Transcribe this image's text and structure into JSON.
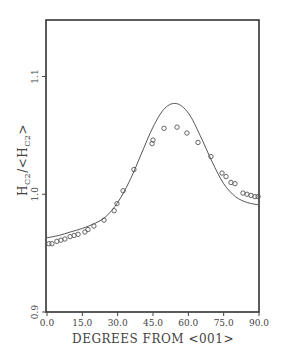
{
  "chart_data": {
    "type": "scatter",
    "title": "",
    "xlabel": "DEGREES FROM <001>",
    "ylabel": "H_C2/<H_C2>",
    "ylabel_parts": {
      "main": "H",
      "sub": "C2",
      "sep": "/<H",
      "sub2": "C2",
      "end": ">"
    },
    "xlim": [
      0,
      90
    ],
    "ylim": [
      0.9,
      1.148
    ],
    "x_ticks": [
      0,
      15,
      30,
      45,
      60,
      75,
      90
    ],
    "x_tick_labels": [
      "0.0",
      "15.0",
      "30.0",
      "45.0",
      "60.0",
      "75.0",
      "90.0"
    ],
    "y_ticks": [
      0.9,
      1.0,
      1.1
    ],
    "y_tick_labels": [
      "0.9",
      "1.0",
      "1.1"
    ],
    "grid": false,
    "legend": null,
    "series": [
      {
        "name": "measured",
        "style": "open-circles",
        "x": [
          0.8,
          2.1,
          4.2,
          5.9,
          7.6,
          9.8,
          11.5,
          13.2,
          16.1,
          17.4,
          19.9,
          24.2,
          28.5,
          29.7,
          32.3,
          36.9,
          44.6,
          45.0,
          49.7,
          55.2,
          59.4,
          64.1,
          69.6,
          74.3,
          76.0,
          78.1,
          79.8,
          83.2,
          84.9,
          86.6,
          88.3,
          89.6
        ],
        "y": [
          0.958,
          0.958,
          0.96,
          0.961,
          0.962,
          0.964,
          0.965,
          0.966,
          0.968,
          0.97,
          0.973,
          0.978,
          0.986,
          0.992,
          1.003,
          1.021,
          1.043,
          1.046,
          1.056,
          1.057,
          1.052,
          1.044,
          1.032,
          1.018,
          1.015,
          1.01,
          1.009,
          1.001,
          1.0,
          0.999,
          0.998,
          0.998
        ]
      },
      {
        "name": "theory",
        "style": "solid-line",
        "x": [
          0,
          5,
          10,
          15,
          20,
          25,
          30,
          35,
          40,
          45,
          50,
          55,
          60,
          65,
          70,
          75,
          80,
          85,
          90
        ],
        "y": [
          0.963,
          0.965,
          0.968,
          0.971,
          0.975,
          0.981,
          0.993,
          1.011,
          1.034,
          1.057,
          1.073,
          1.077,
          1.069,
          1.05,
          1.028,
          1.009,
          0.998,
          0.993,
          0.991
        ]
      }
    ]
  }
}
